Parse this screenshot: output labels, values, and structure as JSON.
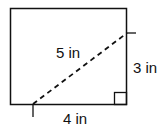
{
  "diagram": {
    "shape": "rectangle",
    "labels": {
      "diagonal": "5 in",
      "height": "3 in",
      "base": "4 in"
    },
    "right_angle_marker": true,
    "diagonal_style": "dashed"
  }
}
